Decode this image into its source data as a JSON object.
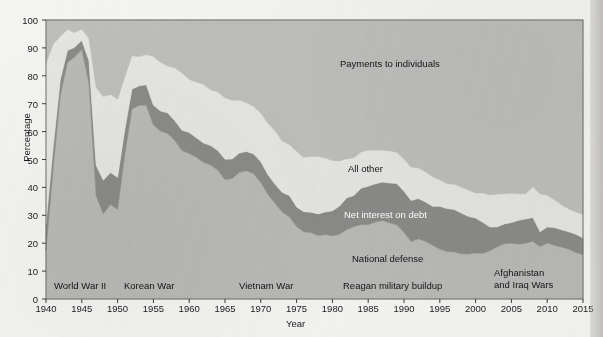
{
  "chart_data": {
    "type": "area",
    "title": "",
    "xlabel": "Year",
    "ylabel": "Percentage",
    "xlim": [
      1940,
      2015
    ],
    "ylim": [
      0,
      100
    ],
    "grid": false,
    "stacked": true,
    "legend_position": "in-plot-annotations",
    "xticks": [
      1940,
      1945,
      1950,
      1955,
      1960,
      1965,
      1970,
      1975,
      1980,
      1985,
      1990,
      1995,
      2000,
      2005,
      2010,
      2015
    ],
    "yticks": [
      0,
      10,
      20,
      30,
      40,
      50,
      60,
      70,
      80,
      90,
      100
    ],
    "x": [
      1940,
      1941,
      1942,
      1943,
      1944,
      1945,
      1946,
      1947,
      1948,
      1949,
      1950,
      1951,
      1952,
      1953,
      1954,
      1955,
      1956,
      1957,
      1958,
      1959,
      1960,
      1961,
      1962,
      1963,
      1964,
      1965,
      1966,
      1967,
      1968,
      1969,
      1970,
      1971,
      1972,
      1973,
      1974,
      1975,
      1976,
      1977,
      1978,
      1979,
      1980,
      1981,
      1982,
      1983,
      1984,
      1985,
      1986,
      1987,
      1988,
      1989,
      1990,
      1991,
      1992,
      1993,
      1994,
      1995,
      1996,
      1997,
      1998,
      1999,
      2000,
      2001,
      2002,
      2003,
      2004,
      2005,
      2006,
      2007,
      2008,
      2009,
      2010,
      2011,
      2012,
      2013,
      2014,
      2015
    ],
    "series": [
      {
        "name": "National defense",
        "color": "#b8b8b6",
        "values": [
          17.5,
          47.0,
          73.0,
          84.9,
          86.7,
          89.5,
          77.3,
          37.1,
          30.6,
          33.9,
          32.2,
          51.8,
          68.1,
          69.4,
          69.5,
          62.4,
          60.2,
          59.3,
          56.8,
          53.2,
          52.2,
          50.8,
          49.0,
          48.0,
          46.2,
          42.8,
          43.2,
          45.4,
          46.0,
          44.9,
          41.8,
          37.5,
          34.3,
          31.2,
          29.5,
          26.0,
          24.1,
          23.8,
          22.8,
          23.1,
          22.7,
          23.2,
          24.9,
          26.0,
          26.7,
          26.7,
          27.6,
          28.1,
          27.3,
          26.6,
          23.9,
          20.6,
          21.6,
          20.7,
          19.3,
          17.9,
          17.0,
          16.9,
          16.2,
          16.1,
          16.5,
          16.4,
          17.3,
          18.7,
          19.9,
          20.0,
          19.7,
          20.0,
          20.7,
          18.8,
          20.1,
          19.3,
          18.6,
          17.9,
          16.7,
          15.9
        ]
      },
      {
        "name": "Net interest on debt",
        "color": "#8a8a88",
        "values": [
          9.5,
          7.3,
          5.6,
          4.2,
          3.5,
          3.2,
          8.1,
          10.8,
          12.0,
          11.4,
          11.4,
          8.8,
          7.1,
          7.0,
          7.3,
          7.1,
          7.2,
          7.4,
          7.1,
          7.3,
          7.5,
          7.0,
          6.9,
          7.0,
          7.0,
          7.3,
          7.0,
          6.9,
          6.9,
          7.1,
          7.4,
          7.0,
          6.8,
          7.0,
          7.6,
          7.0,
          7.2,
          7.3,
          7.7,
          8.1,
          8.9,
          10.1,
          11.4,
          11.1,
          13.0,
          13.7,
          13.7,
          13.8,
          14.3,
          14.8,
          14.7,
          14.7,
          14.4,
          14.1,
          13.9,
          15.3,
          15.4,
          15.2,
          14.6,
          13.5,
          12.5,
          11.1,
          8.5,
          7.1,
          7.0,
          7.4,
          8.5,
          8.7,
          8.5,
          5.3,
          5.7,
          6.3,
          6.2,
          6.2,
          6.5,
          6.0
        ]
      },
      {
        "name": "All other",
        "color": "#e4e4e2",
        "values": [
          57.5,
          37.0,
          15.5,
          7.5,
          5.3,
          4.0,
          8.0,
          28.0,
          30.0,
          28.0,
          28.0,
          19.0,
          12.0,
          10.5,
          10.8,
          17.4,
          17.5,
          16.8,
          19.0,
          20.5,
          19.0,
          20.0,
          21.0,
          20.0,
          21.0,
          22.0,
          21.0,
          19.0,
          17.5,
          17.0,
          17.5,
          18.5,
          19.2,
          18.4,
          18.3,
          20.0,
          19.5,
          20.0,
          20.7,
          19.3,
          18.0,
          16.2,
          14.0,
          13.5,
          13.0,
          13.0,
          12.0,
          11.5,
          11.5,
          11.2,
          11.5,
          12.0,
          11.0,
          10.8,
          10.6,
          9.5,
          9.0,
          9.0,
          9.3,
          9.5,
          9.0,
          10.5,
          11.5,
          11.8,
          10.8,
          10.5,
          9.5,
          9.0,
          11.0,
          13.5,
          11.5,
          10.0,
          9.0,
          8.2,
          8.0,
          8.5
        ]
      },
      {
        "name": "Payments to individuals",
        "color": "#bdbdbb",
        "values": [
          15.5,
          8.7,
          5.9,
          3.4,
          4.5,
          3.3,
          6.6,
          24.1,
          27.4,
          26.7,
          28.4,
          20.4,
          12.8,
          13.1,
          12.4,
          13.1,
          15.1,
          16.5,
          17.1,
          19.0,
          21.3,
          22.2,
          23.1,
          25.0,
          25.8,
          27.9,
          28.8,
          28.7,
          29.6,
          31.0,
          33.3,
          37.0,
          39.7,
          43.4,
          44.6,
          47.0,
          49.2,
          48.9,
          48.8,
          49.5,
          50.4,
          50.5,
          49.7,
          49.4,
          47.3,
          46.6,
          46.7,
          46.6,
          46.9,
          47.4,
          49.9,
          52.7,
          53.0,
          54.4,
          56.2,
          57.3,
          58.6,
          58.9,
          59.9,
          60.9,
          62.0,
          62.0,
          62.7,
          62.4,
          62.3,
          62.1,
          62.3,
          62.3,
          59.8,
          62.4,
          62.7,
          64.4,
          66.2,
          67.7,
          68.8,
          69.6
        ]
      }
    ],
    "series_labels": [
      {
        "name": "Payments to individuals",
        "text": "Payments to individuals",
        "x_px": 340,
        "y_px": 58,
        "color": "#141414"
      },
      {
        "name": "All other",
        "text": "All other",
        "x_px": 348,
        "y_px": 163,
        "color": "#141414"
      },
      {
        "name": "Net interest on debt",
        "text": "Net interest on debt",
        "x_px": 344,
        "y_px": 209,
        "color": "#ffffff"
      },
      {
        "name": "National defense",
        "text": "National defense",
        "x_px": 352,
        "y_px": 253,
        "color": "#141414"
      }
    ],
    "event_annotations": [
      {
        "name": "world-war-ii",
        "text": "World War II",
        "x_px": 54,
        "y_px": 280
      },
      {
        "name": "korean-war",
        "text": "Korean War",
        "x_px": 124,
        "y_px": 280
      },
      {
        "name": "vietnam-war",
        "text": "Vietnam War",
        "x_px": 239,
        "y_px": 280
      },
      {
        "name": "reagan-military-buildup",
        "text": "Reagan military buildup",
        "x_px": 343,
        "y_px": 280
      },
      {
        "name": "afghanistan-and-iraq-wars",
        "text": "Afghanistan\nand Iraq Wars",
        "x_px": 494,
        "y_px": 267
      }
    ]
  }
}
